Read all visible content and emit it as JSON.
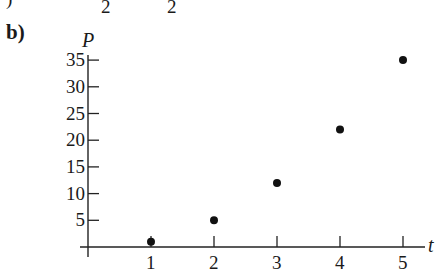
{
  "header": {
    "fragment_left": ")",
    "fragment_denoms": [
      "2",
      "2"
    ]
  },
  "part_label": "b)",
  "chart_data": {
    "type": "scatter",
    "title": "",
    "xlabel": "t",
    "ylabel": "P",
    "x": [
      1,
      2,
      3,
      4,
      5
    ],
    "series": [
      {
        "name": "P",
        "values": [
          1,
          5,
          12,
          22,
          35
        ]
      }
    ],
    "xticks": [
      "1",
      "2",
      "3",
      "4",
      "5"
    ],
    "yticks": [
      "5",
      "10",
      "15",
      "20",
      "25",
      "30",
      "35"
    ],
    "xlim": [
      0,
      5.3
    ],
    "ylim": [
      0,
      36
    ],
    "grid": false,
    "legend": null,
    "marker_color": "#111111"
  }
}
